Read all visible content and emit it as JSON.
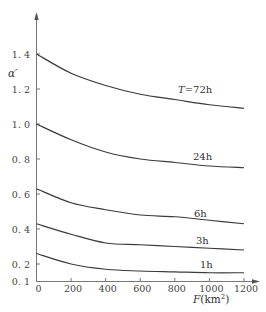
{
  "chart_data": {
    "type": "line",
    "title": "",
    "xlabel": "F(km²)",
    "ylabel": "α′",
    "xlim": [
      0,
      1200
    ],
    "ylim": [
      0.1,
      1.5
    ],
    "grid": false,
    "legend": "inline curve labels at right end",
    "x_ticks": [
      0,
      200,
      400,
      600,
      800,
      1000,
      1200
    ],
    "x_tick_labels": [
      "0",
      "200",
      "400",
      "600",
      "800",
      "1000",
      "1200"
    ],
    "y_ticks": [
      0.1,
      0.2,
      0.4,
      0.6,
      0.8,
      1.0,
      1.2,
      1.4
    ],
    "y_tick_labels": [
      "0. 1",
      "0. 2",
      "0. 4",
      "0. 6",
      "0. 8",
      "1. 0",
      "1. 2",
      "1. 4"
    ],
    "x": [
      0,
      200,
      400,
      600,
      800,
      1000,
      1200
    ],
    "series": [
      {
        "name": "T=72h",
        "label": "T=72h",
        "values": [
          1.4,
          1.29,
          1.22,
          1.17,
          1.14,
          1.11,
          1.09
        ]
      },
      {
        "name": "24h",
        "label": "24h",
        "values": [
          1.0,
          0.91,
          0.84,
          0.8,
          0.78,
          0.76,
          0.75
        ]
      },
      {
        "name": "6h",
        "label": "6h",
        "values": [
          0.63,
          0.55,
          0.51,
          0.48,
          0.47,
          0.45,
          0.43
        ]
      },
      {
        "name": "3h",
        "label": "3h",
        "values": [
          0.43,
          0.37,
          0.32,
          0.31,
          0.3,
          0.29,
          0.28
        ]
      },
      {
        "name": "1h",
        "label": "1h",
        "values": [
          0.26,
          0.2,
          0.17,
          0.16,
          0.155,
          0.15,
          0.15
        ]
      }
    ]
  }
}
